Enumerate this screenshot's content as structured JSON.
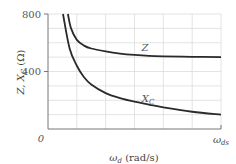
{
  "chart_data": {
    "type": "line",
    "title": "",
    "xlabel": "ω_d (rad/s)",
    "ylabel": "Z, X_C (Ω)",
    "x_tick_labels": [
      "0",
      "ω_ds"
    ],
    "y_tick_labels": [
      "0",
      "400",
      "800"
    ],
    "yticks": [
      0,
      400,
      800
    ],
    "ylim": [
      0,
      800
    ],
    "xlim": [
      0,
      6
    ],
    "grid": true,
    "grid_x_divisions": 6,
    "grid_y_step": 100,
    "legend": "inline labels",
    "series": [
      {
        "name": "Z",
        "x": [
          0.69,
          0.8,
          1.0,
          1.25,
          1.5,
          2.0,
          2.5,
          3.0,
          3.5,
          4.0,
          5.0,
          6.0
        ],
        "values": [
          800,
          700,
          620,
          580,
          560,
          540,
          525,
          515,
          508,
          505,
          502,
          500
        ]
      },
      {
        "name": "X_C",
        "x": [
          0.52,
          0.75,
          1.0,
          1.25,
          1.5,
          2.0,
          2.5,
          3.0,
          3.5,
          4.0,
          5.0,
          6.0
        ],
        "values": [
          800,
          560,
          440,
          360,
          310,
          250,
          215,
          190,
          170,
          150,
          120,
          100
        ]
      }
    ]
  },
  "labels": {
    "y_axis": "Z, X",
    "y_axis_sub": "C",
    "y_axis_unit": " (Ω)",
    "x_axis_omega": "ω",
    "x_axis_sub": "d",
    "x_axis_unit": " (rad/s)",
    "x_end_omega": "ω",
    "x_end_sub": "ds",
    "origin": "0",
    "y400": "400",
    "y800": "800",
    "series_z": "Z",
    "series_xc": "X",
    "series_xc_sub": "C"
  }
}
